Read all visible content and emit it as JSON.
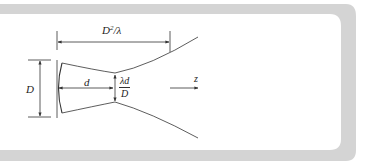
{
  "figure": {
    "type": "gaussian-beam-diffraction-diagram",
    "frame_color": "#d4d4d4",
    "line_color": "#333333",
    "labels": {
      "far_field_distance": {
        "base": "D",
        "sup": "2",
        "rest": "/λ"
      },
      "aperture_diameter": "D",
      "waist_distance": "d",
      "waist_size": {
        "numerator": "λd",
        "denominator": "D"
      },
      "axis": "z"
    }
  }
}
